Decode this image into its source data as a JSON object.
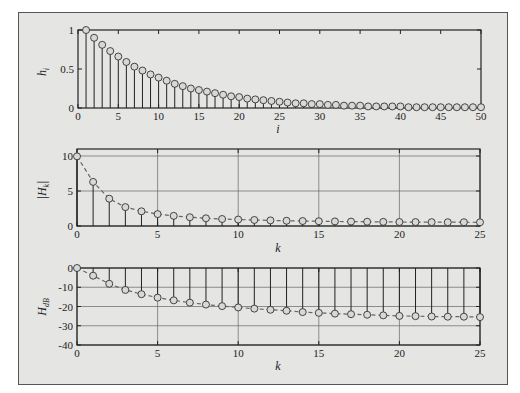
{
  "chart_data": [
    {
      "type": "stem",
      "ylabel": "h_i",
      "xlabel": "i",
      "xlim": [
        0,
        50
      ],
      "ylim": [
        0,
        1
      ],
      "xticks": [
        0,
        5,
        10,
        15,
        20,
        25,
        30,
        35,
        40,
        45,
        50
      ],
      "yticks": [
        0,
        0.5,
        1
      ],
      "ytick_labels": [
        "0",
        "0.5",
        "1"
      ],
      "grid": false,
      "x": [
        1,
        2,
        3,
        4,
        5,
        6,
        7,
        8,
        9,
        10,
        11,
        12,
        13,
        14,
        15,
        16,
        17,
        18,
        19,
        20,
        21,
        22,
        23,
        24,
        25,
        26,
        27,
        28,
        29,
        30,
        31,
        32,
        33,
        34,
        35,
        36,
        37,
        38,
        39,
        40,
        41,
        42,
        43,
        44,
        45,
        46,
        47,
        48,
        49,
        50
      ],
      "values": [
        1.0,
        0.9,
        0.81,
        0.73,
        0.66,
        0.59,
        0.53,
        0.48,
        0.43,
        0.39,
        0.35,
        0.31,
        0.28,
        0.25,
        0.23,
        0.21,
        0.19,
        0.17,
        0.15,
        0.14,
        0.12,
        0.11,
        0.1,
        0.09,
        0.08,
        0.07,
        0.06,
        0.06,
        0.05,
        0.05,
        0.04,
        0.04,
        0.03,
        0.03,
        0.03,
        0.02,
        0.02,
        0.02,
        0.02,
        0.02,
        0.01,
        0.01,
        0.01,
        0.01,
        0.01,
        0.01,
        0.01,
        0.01,
        0.01,
        0.01
      ]
    },
    {
      "type": "stem",
      "ylabel": "|H_k|",
      "xlabel": "k",
      "xlim": [
        0,
        25
      ],
      "ylim": [
        0,
        11
      ],
      "xticks": [
        0,
        5,
        10,
        15,
        20,
        25
      ],
      "yticks": [
        0,
        5,
        10
      ],
      "ytick_labels": [
        "0",
        "5",
        "10"
      ],
      "grid": true,
      "dashed_envelope": true,
      "x": [
        0,
        1,
        2,
        3,
        4,
        5,
        6,
        7,
        8,
        9,
        10,
        11,
        12,
        13,
        14,
        15,
        16,
        17,
        18,
        19,
        20,
        21,
        22,
        23,
        24,
        25
      ],
      "values": [
        9.95,
        6.3,
        3.9,
        2.7,
        2.1,
        1.7,
        1.45,
        1.25,
        1.1,
        1.0,
        0.92,
        0.86,
        0.8,
        0.75,
        0.71,
        0.68,
        0.65,
        0.63,
        0.61,
        0.59,
        0.57,
        0.56,
        0.55,
        0.54,
        0.54,
        0.53
      ]
    },
    {
      "type": "stem",
      "ylabel": "H_dB",
      "xlabel": "k",
      "xlim": [
        0,
        25
      ],
      "ylim": [
        -40,
        0
      ],
      "xticks": [
        0,
        5,
        10,
        15,
        20,
        25
      ],
      "yticks": [
        0,
        -10,
        -20,
        -30,
        -40
      ],
      "ytick_labels": [
        "0",
        "-10",
        "-20",
        "-30",
        "-40"
      ],
      "grid": true,
      "dashed_envelope": true,
      "x": [
        0,
        1,
        2,
        3,
        4,
        5,
        6,
        7,
        8,
        9,
        10,
        11,
        12,
        13,
        14,
        15,
        16,
        17,
        18,
        19,
        20,
        21,
        22,
        23,
        24,
        25
      ],
      "values": [
        0,
        -4.0,
        -8.2,
        -11.4,
        -13.6,
        -15.4,
        -16.8,
        -18.0,
        -19.0,
        -19.8,
        -20.5,
        -21.1,
        -21.7,
        -22.2,
        -22.9,
        -23.3,
        -23.7,
        -24.0,
        -24.3,
        -24.6,
        -24.9,
        -25.0,
        -25.2,
        -25.3,
        -25.3,
        -25.5
      ]
    }
  ],
  "labels": {
    "p1_ylabel_main": "h",
    "p1_ylabel_sub": "i",
    "p1_xlabel": "i",
    "p2_ylabel_main": "|H",
    "p2_ylabel_sub": "k",
    "p2_ylabel_end": "|",
    "p2_xlabel": "k",
    "p3_ylabel_main": "H",
    "p3_ylabel_sub": "dB",
    "p3_xlabel": "k"
  }
}
